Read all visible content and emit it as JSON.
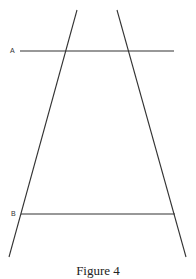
{
  "figure": {
    "caption": "Figure 4",
    "colors": {
      "line": "#333333",
      "background": "#ffffff"
    },
    "labels": {
      "a": "A",
      "b": "B"
    },
    "lines": {
      "left_slant": {
        "x1": 77,
        "y1": 10,
        "x2": 9,
        "y2": 257
      },
      "right_slant": {
        "x1": 117,
        "y1": 10,
        "x2": 186,
        "y2": 257
      },
      "line_a": {
        "x1": 20,
        "y1": 51,
        "x2": 174,
        "y2": 51
      },
      "line_b": {
        "x1": 21,
        "y1": 214,
        "x2": 175,
        "y2": 214
      }
    }
  }
}
